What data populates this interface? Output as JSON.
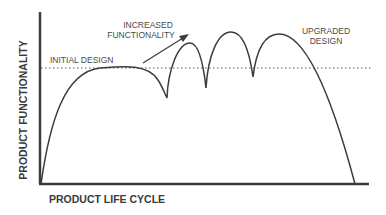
{
  "diagram": {
    "y_axis_label": "PRODUCT FUNCTIONALITY",
    "x_axis_label": "PRODUCT LIFE CYCLE",
    "baseline_label": "INITIAL DESIGN",
    "arrow_label_line1": "INCREASED",
    "arrow_label_line2": "FUNCTIONALITY",
    "upgrade_label_line1": "UPGRADED",
    "upgrade_label_line2": "DESIGN",
    "colors": {
      "curve": "#3c3c3c",
      "axis": "#3c3c3c",
      "text": "#4a4a4a",
      "dotted": "#555555"
    }
  }
}
